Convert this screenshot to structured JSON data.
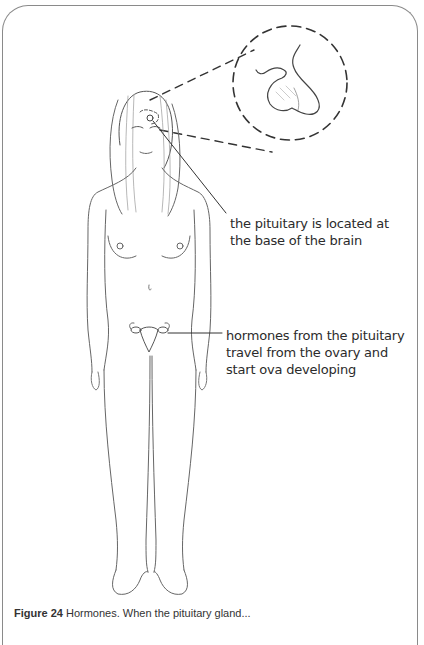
{
  "figure": {
    "labels": {
      "pituitary": {
        "lines": [
          "the pituitary is located at",
          "the base of the brain"
        ]
      },
      "hormones": {
        "lines": [
          "hormones from the pituitary",
          "travel from the ovary and",
          "start ova developing"
        ]
      }
    },
    "inset": {
      "name": "pituitary gland magnified view",
      "style": "dashed circle"
    },
    "caption": {
      "number": "Figure 24",
      "text": "Hormones. When the pituitary gland..."
    }
  },
  "colors": {
    "frame": "#8a8a8a",
    "ink": "#3a3a3a",
    "text": "#2b2b2b"
  }
}
